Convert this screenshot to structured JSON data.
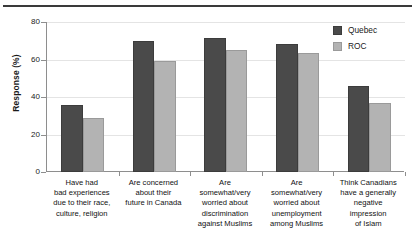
{
  "chart_data": {
    "type": "bar",
    "title": "",
    "xlabel": "",
    "ylabel": "Response (%)",
    "ylim": [
      0,
      80
    ],
    "yticks": [
      0,
      20,
      40,
      60,
      80
    ],
    "ytick_labels": [
      "0",
      "20",
      "40",
      "60",
      "80"
    ],
    "grid": true,
    "legend_position": "top-right",
    "categories": [
      "Have had bad experiences due to their race, culture, religion",
      "Are concerned about their future in Canada",
      "Are somewhat/very worried about discrimination against Muslims",
      "Are somewhat/very worried about unemployment among Muslims",
      "Think Canadians have a generally negative impression of Islam"
    ],
    "category_lines": [
      [
        "Have had",
        "bad experiences",
        "due to their race,",
        "culture, religion"
      ],
      [
        "Are concerned",
        "about their",
        "future in Canada"
      ],
      [
        "Are",
        "somewhat/very",
        "worried about",
        "discrimination",
        "against Muslims"
      ],
      [
        "Are",
        "somewhat/very",
        "worried about",
        "unemployment",
        "among Muslims"
      ],
      [
        "Think Canadians",
        "have a generally",
        "negative",
        "impression",
        "of Islam"
      ]
    ],
    "series": [
      {
        "name": "Quebec",
        "color": "#4a4a4a",
        "values": [
          36,
          70,
          71.5,
          68.5,
          46
        ]
      },
      {
        "name": "ROC",
        "color": "#b3b3b3",
        "values": [
          29,
          59,
          65,
          63.5,
          37
        ]
      }
    ]
  },
  "legend": {
    "items": [
      {
        "label": "Quebec"
      },
      {
        "label": "ROC"
      }
    ]
  }
}
